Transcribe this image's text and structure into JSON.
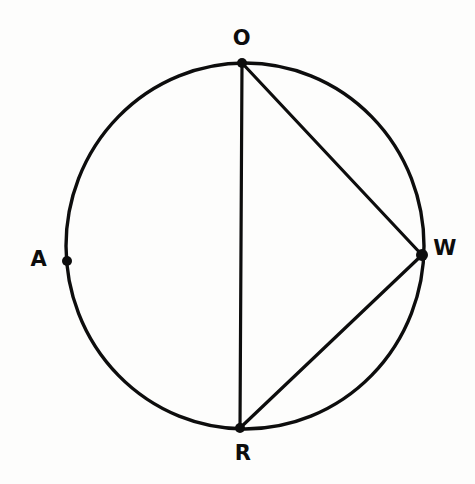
{
  "figure": {
    "kind": "circle-geometry-diagram",
    "background_color": "#fdfdfc",
    "ink_color": "#0d0d0d",
    "canvas": {
      "width": 475,
      "height": 484
    }
  },
  "circle": {
    "name": "main-circle",
    "center_x": 245,
    "center_y": 246,
    "radius_x": 179,
    "radius_y": 183,
    "stroke_width": 3.4,
    "stroke_color": "#0d0d0d",
    "fill": "none"
  },
  "points": [
    {
      "id": "O",
      "label": "O",
      "x": 242,
      "y": 63,
      "dot_radius": 5,
      "label_x": 242,
      "label_y": 38,
      "position_note": "top of circle"
    },
    {
      "id": "A",
      "label": "A",
      "x": 67,
      "y": 261,
      "dot_radius": 5,
      "label_x": 39,
      "label_y": 259,
      "position_note": "left of circle"
    },
    {
      "id": "W",
      "label": "W",
      "x": 422,
      "y": 255,
      "dot_radius": 6,
      "label_x": 445,
      "label_y": 248,
      "position_note": "right of circle"
    },
    {
      "id": "R",
      "label": "R",
      "x": 240,
      "y": 428,
      "dot_radius": 5,
      "label_x": 243,
      "label_y": 453,
      "position_note": "bottom of circle"
    }
  ],
  "chords": [
    {
      "id": "OR",
      "name": "chord-o-r",
      "from": "O",
      "to": "R",
      "x1": 242,
      "y1": 63,
      "x2": 240,
      "y2": 428,
      "stroke_width": 3.2,
      "note": "vertical diameter"
    },
    {
      "id": "OW",
      "name": "chord-o-w",
      "from": "O",
      "to": "W",
      "x1": 242,
      "y1": 63,
      "x2": 422,
      "y2": 255,
      "stroke_width": 3.2,
      "note": "chord"
    },
    {
      "id": "WR",
      "name": "chord-w-r",
      "from": "W",
      "to": "R",
      "x1": 422,
      "y1": 255,
      "x2": 240,
      "y2": 428,
      "stroke_width": 3.2,
      "note": "chord"
    }
  ]
}
